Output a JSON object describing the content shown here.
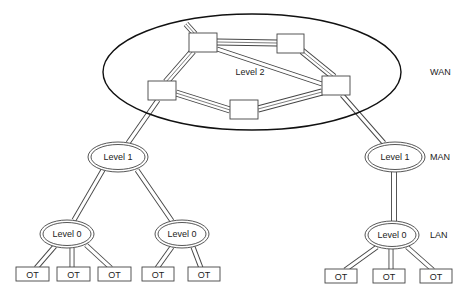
{
  "diagram": {
    "type": "hierarchical network topology",
    "wan_region": {
      "label": "Level 2",
      "cx": 252,
      "cy": 72,
      "rx": 149,
      "ry": 58
    },
    "tiers": [
      {
        "id": "wan",
        "label": "WAN",
        "x": 430,
        "y": 75
      },
      {
        "id": "man",
        "label": "MAN",
        "x": 430,
        "y": 160
      },
      {
        "id": "lan",
        "label": "LAN",
        "x": 430,
        "y": 238
      }
    ],
    "routers": [
      {
        "id": "r1",
        "x": 189,
        "y": 33,
        "w": 28,
        "h": 19
      },
      {
        "id": "r2",
        "x": 277,
        "y": 34,
        "w": 27,
        "h": 19
      },
      {
        "id": "r3",
        "x": 322,
        "y": 76,
        "w": 28,
        "h": 19
      },
      {
        "id": "r4",
        "x": 148,
        "y": 81,
        "w": 28,
        "h": 19
      },
      {
        "id": "r5",
        "x": 230,
        "y": 100,
        "w": 28,
        "h": 19
      }
    ],
    "level1_nodes": [
      {
        "id": "l1-left",
        "label": "Level 1",
        "cx": 118,
        "cy": 157
      },
      {
        "id": "l1-right",
        "label": "Level 1",
        "cx": 395,
        "cy": 157
      }
    ],
    "level0_nodes": [
      {
        "id": "l0-left",
        "label": "Level 0",
        "cx": 67,
        "cy": 234
      },
      {
        "id": "l0-mid",
        "label": "Level 0",
        "cx": 182,
        "cy": 234
      },
      {
        "id": "l0-right",
        "label": "Level 0",
        "cx": 392,
        "cy": 235
      }
    ],
    "terminals": [
      {
        "id": "ot1",
        "label": "OT",
        "x": 16,
        "y": 267,
        "parent": "l0-left"
      },
      {
        "id": "ot2",
        "label": "OT",
        "x": 57,
        "y": 267,
        "parent": "l0-left"
      },
      {
        "id": "ot3",
        "label": "OT",
        "x": 98,
        "y": 267,
        "parent": "l0-left"
      },
      {
        "id": "ot4",
        "label": "OT",
        "x": 142,
        "y": 267,
        "parent": "l0-mid"
      },
      {
        "id": "ot5",
        "label": "OT",
        "x": 188,
        "y": 267,
        "parent": "l0-mid"
      },
      {
        "id": "ot6",
        "label": "OT",
        "x": 325,
        "y": 269,
        "parent": "l0-right"
      },
      {
        "id": "ot7",
        "label": "OT",
        "x": 373,
        "y": 269,
        "parent": "l0-right"
      },
      {
        "id": "ot8",
        "label": "OT",
        "x": 420,
        "y": 269,
        "parent": "l0-right"
      }
    ],
    "links": [
      {
        "from": "r1",
        "to": "r2",
        "style": "triple"
      },
      {
        "from": "r1",
        "to": "r3",
        "style": "double"
      },
      {
        "from": "r2",
        "to": "r3",
        "style": "triple"
      },
      {
        "from": "r1",
        "to": "r4",
        "style": "triple"
      },
      {
        "from": "r4",
        "to": "r5",
        "style": "triple"
      },
      {
        "from": "r5",
        "to": "r3",
        "style": "triple"
      },
      {
        "from": "r1",
        "to": "external",
        "style": "triple"
      },
      {
        "from": "r4",
        "to": "l1-left",
        "style": "double"
      },
      {
        "from": "r3",
        "to": "l1-right",
        "style": "double"
      },
      {
        "from": "l1-left",
        "to": "l0-left",
        "style": "double"
      },
      {
        "from": "l1-left",
        "to": "l0-mid",
        "style": "double"
      },
      {
        "from": "l1-right",
        "to": "l0-right",
        "style": "double"
      }
    ]
  }
}
